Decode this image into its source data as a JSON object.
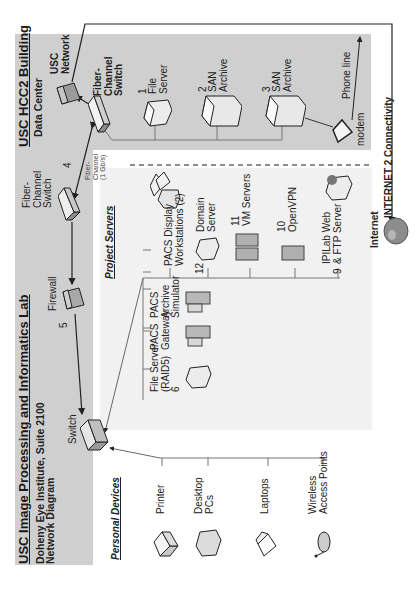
{
  "lab_box": {
    "title": "USC Image Processing and Informatics Lab",
    "subtitle": "Doheny Eye Institute, Suite 2100",
    "subtitle2": "Network Diagram",
    "switch_label": "Switch",
    "firewall_label": "Firewall",
    "fc_switch_label": "Fiber-\nChannel\nSwitch",
    "link_5": "5"
  },
  "datacenter_box": {
    "title": "USC HCC2 Building",
    "subtitle": "Data Center",
    "usc_network_label": "USC\nNetwork",
    "fc_switch_label": "Fiber-\nChannel\nSwitch",
    "servers": [
      {
        "num": "1",
        "label": "File\nServer"
      },
      {
        "num": "2",
        "label": "SAN\nArchive"
      },
      {
        "num": "3",
        "label": "SAN\nArchive"
      }
    ],
    "modem_label": "modem",
    "phone_label": "Phone line"
  },
  "link_4": {
    "num": "4",
    "label": "Fiber-\nChannel\n(1 Gb/s)"
  },
  "internet": {
    "connectivity_label": "INTERNET 2 Connectivity",
    "internet_label": "Internet"
  },
  "personal_devices": {
    "heading": "Personal Devices",
    "items": [
      {
        "label": "Printer"
      },
      {
        "label": "Desktop\nPCs"
      },
      {
        "label": "Laptops"
      },
      {
        "label": "Wireless\nAccess Points"
      }
    ]
  },
  "project_servers": {
    "heading": "Project Servers",
    "row1": [
      {
        "label": "PACS\nArchive\nSimulator"
      },
      {
        "label": "PACS\nGateway"
      },
      {
        "label": "File Server\n(RAID5)\n6"
      },
      {
        "label": "SMT Server\n7"
      },
      {
        "label": "RT ePR\n8"
      },
      {
        "label": "BAA Server"
      }
    ],
    "row2": [
      {
        "num": "",
        "label": "PACS Display\nWorkstations (2)"
      },
      {
        "num": "12",
        "label": "Domain\nServer"
      },
      {
        "num": "11",
        "label": "VM Servers"
      },
      {
        "num": "10",
        "label": "OpenVPN"
      },
      {
        "num": "9",
        "label": "IPILab Web\n& FTP Server"
      }
    ]
  },
  "colors": {
    "box_gray": "#cfcfcf",
    "panel_light": "#f1f1f1",
    "line": "#555555"
  }
}
